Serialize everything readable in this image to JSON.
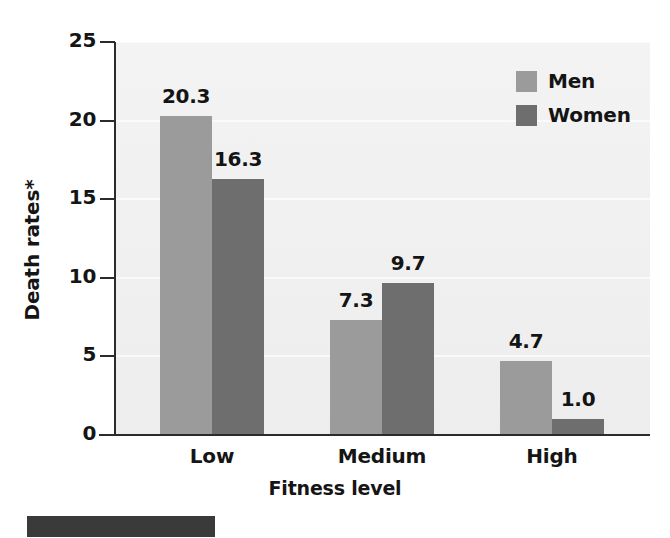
{
  "chart_data": {
    "type": "bar",
    "title": "",
    "subtitle": "",
    "xlabel": "Fitness level",
    "ylabel": "Death rates*",
    "categories": [
      "Low",
      "Medium",
      "High"
    ],
    "series": [
      {
        "name": "Men",
        "color": "#9b9b9b",
        "values": [
          20.3,
          7.3,
          4.7
        ]
      },
      {
        "name": "Women",
        "color": "#6e6e6e",
        "values": [
          16.3,
          9.7,
          1.0
        ]
      }
    ],
    "value_labels": {
      "Men": [
        "20.3",
        "7.3",
        "4.7"
      ],
      "Women": [
        "16.3",
        "9.7",
        "1.0"
      ]
    },
    "ylim": [
      0,
      25
    ],
    "yticks": [
      0,
      5,
      10,
      15,
      20,
      25
    ],
    "ytick_labels": [
      "0",
      "5",
      "10",
      "15",
      "20",
      "25"
    ],
    "grid": "horizontal-faint",
    "legend_position": "top-right",
    "annotations": [
      "* asterisk footnote marker on y-axis label"
    ]
  },
  "axes": {
    "y_title": "Death rates*",
    "x_title": "Fitness level"
  },
  "legend": {
    "entries": [
      {
        "label": "Men",
        "color": "#9b9b9b"
      },
      {
        "label": "Women",
        "color": "#6e6e6e"
      }
    ]
  },
  "colors": {
    "men": "#9b9b9b",
    "women": "#6e6e6e",
    "plot_background": "#f0f0f0",
    "axis": "#2b2b2b",
    "text": "#151515",
    "artifact": "#3a3a3a"
  }
}
